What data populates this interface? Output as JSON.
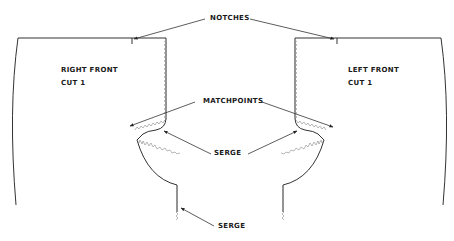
{
  "diagram": {
    "type": "sewing-pattern-diagram",
    "pieces": [
      {
        "id": "right-front",
        "name": "RIGHT FRONT",
        "cut": "CUT 1"
      },
      {
        "id": "left-front",
        "name": "LEFT FRONT",
        "cut": "CUT 1"
      }
    ],
    "callouts": {
      "notches": "NOTCHES",
      "matchpoints": "MATCHPOINTS",
      "serge_middle": "SERGE",
      "serge_bottom": "SERGE"
    },
    "colors": {
      "line": "#333333",
      "serge": "#888888",
      "text": "#1a1a1a",
      "background": "#ffffff"
    }
  }
}
